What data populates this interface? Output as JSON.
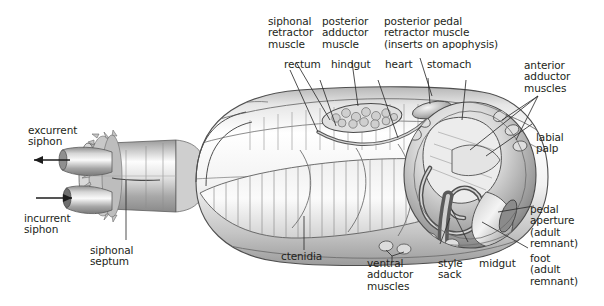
{
  "figure": {
    "background_color": "#ffffff",
    "text_color": "#231f20",
    "line_color": "#3a3a3a"
  },
  "labels": {
    "siphonal_retractor_muscle": "siphonal\nretractor\nmuscle",
    "posterior_adductor_muscle": "posterior\nadductor\nmuscle",
    "posterior_pedal_retractor_muscle": "posterior pedal\nretractor muscle\n(inserts on apophysis)",
    "rectum": "rectum",
    "hindgut": "hindgut",
    "heart": "heart",
    "stomach": "stomach",
    "anterior_adductor_muscles": "anterior\nadductor\nmuscles",
    "labial_palp": "labial\npalp",
    "pedal_aperture": "pedal\naperture\n(adult\nremnant)",
    "foot": "foot\n(adult\nremnant)",
    "midgut": "midgut",
    "style_sack": "style\nsack",
    "ventral_adductor_muscles": "ventral\nadductor\nmuscles",
    "ctenidia": "ctenidia",
    "siphonal_septum": "siphonal\nseptum",
    "excurrent_siphon": "excurrent\nsiphon",
    "incurrent_siphon": "incurrent\nsiphon"
  }
}
